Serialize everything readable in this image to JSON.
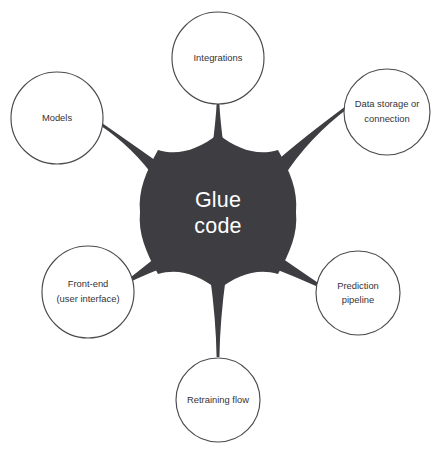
{
  "diagram": {
    "type": "hub-and-spoke",
    "title": "Glue code",
    "background_color": "#ffffff",
    "hub": {
      "label_line1": "Glue",
      "label_line2": "code",
      "fill_color": "#3d3d42",
      "text_color": "#ffffff",
      "center_x": 218,
      "center_y": 212,
      "radius": 78
    },
    "node_style": {
      "fill_color": "#ffffff",
      "stroke_color": "#4a4a4f",
      "text_color": "#333338"
    },
    "nodes": [
      {
        "id": "integrations",
        "lines": [
          "Integrations"
        ],
        "cx": 218,
        "cy": 58,
        "r": 46,
        "angle": 90
      },
      {
        "id": "data-storage-or-connection",
        "lines": [
          "Data storage or",
          "connection"
        ],
        "cx": 387,
        "cy": 112,
        "r": 43,
        "angle": 38
      },
      {
        "id": "prediction-pipeline",
        "lines": [
          "Prediction",
          "pipeline"
        ],
        "cx": 358,
        "cy": 293,
        "r": 42,
        "angle": -32
      },
      {
        "id": "retraining-flow",
        "lines": [
          "Retraining flow"
        ],
        "cx": 218,
        "cy": 400,
        "r": 42,
        "angle": -90
      },
      {
        "id": "front-end-user-interface",
        "lines": [
          "Front-end",
          "(user interface)"
        ],
        "cx": 88,
        "cy": 292,
        "r": 46,
        "angle": -148
      },
      {
        "id": "models",
        "lines": [
          "Models"
        ],
        "cx": 57,
        "cy": 118,
        "r": 46,
        "angle": 142
      }
    ]
  }
}
